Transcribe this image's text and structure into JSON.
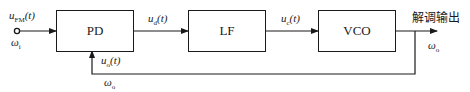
{
  "diagram": {
    "blocks": [
      {
        "id": "pd",
        "label": "PD"
      },
      {
        "id": "lf",
        "label": "LF"
      },
      {
        "id": "vco",
        "label": "VCO"
      }
    ],
    "signals": {
      "input": {
        "var": "u",
        "sub": "FM",
        "arg": "(t)"
      },
      "input_freq": {
        "var": "ω",
        "sub": "i"
      },
      "ud": {
        "var": "u",
        "sub": "d",
        "arg": "(t)"
      },
      "uc": {
        "var": "u",
        "sub": "c",
        "arg": "(t)"
      },
      "uo": {
        "var": "u",
        "sub": "o",
        "arg": "(t)"
      },
      "feedback_freq": {
        "var": "ω",
        "sub": "o"
      },
      "output_freq": {
        "var": "ω",
        "sub": "o"
      }
    },
    "output_label": "解调输出"
  }
}
